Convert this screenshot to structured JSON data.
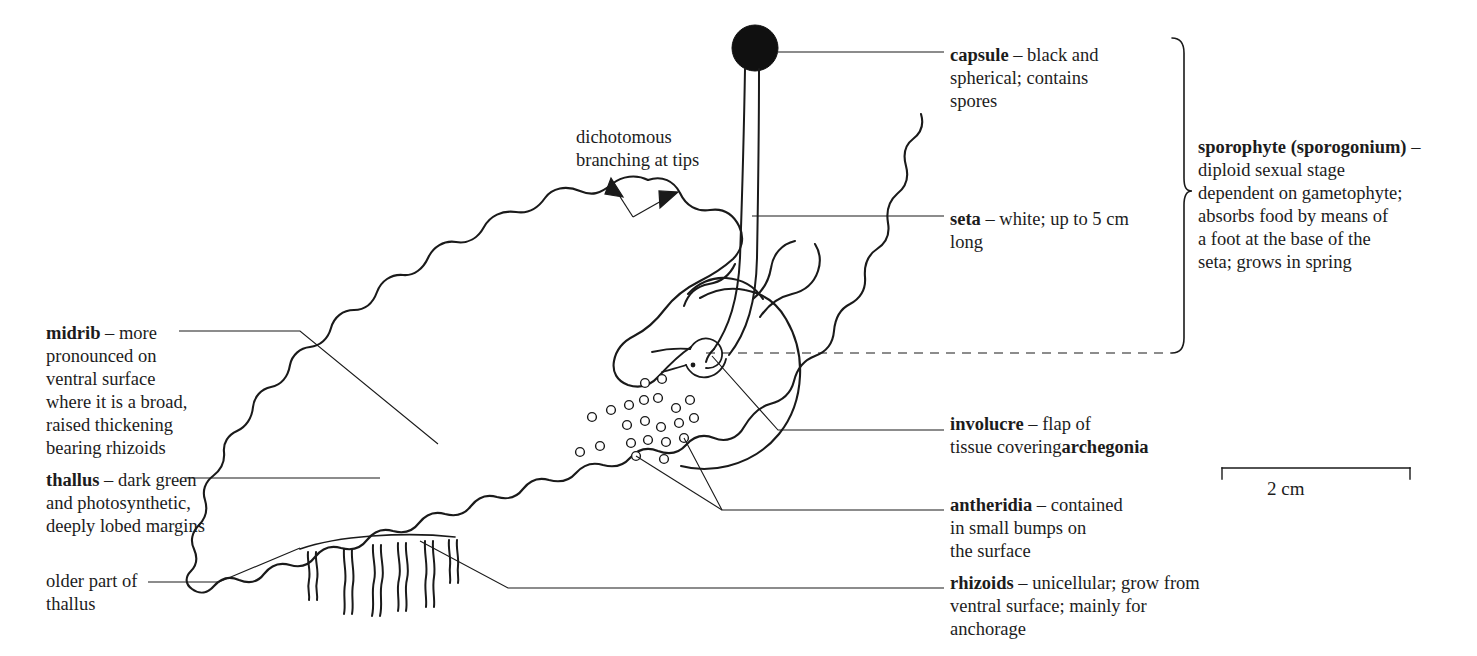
{
  "figure": {
    "organism": "liverwort (thalloid)",
    "ink_color": "#1a1a1a",
    "background_color": "#ffffff"
  },
  "scale_bar": {
    "caption": "2 cm",
    "x_start": 1222,
    "x_end": 1410,
    "y": 468
  },
  "callouts": {
    "capsule": {
      "term": "capsule",
      "dash": " – ",
      "description": "black and\nspherical; contains\nspores",
      "text_x": 950,
      "text_y": 44
    },
    "seta": {
      "term": "seta",
      "dash": " – ",
      "description": "white; up to 5 cm\nlong",
      "text_x": 950,
      "text_y": 208
    },
    "sporophyte": {
      "term": "sporophyte (sporogonium)",
      "dash": " – ",
      "description": "diploid sexual stage\ndependent on gametophyte;\nabsorbs food by means of\na foot at the base of the\nseta; grows in spring",
      "text_x": 1198,
      "text_y": 136
    },
    "involucre": {
      "term": "involucre",
      "dash": " – ",
      "description": "flap of\ntissue covering",
      "term2": "archegonia",
      "text_x": 950,
      "text_y": 413
    },
    "antheridia": {
      "term": "antheridia",
      "dash": " – ",
      "description": "contained\nin small bumps on\nthe surface",
      "text_x": 950,
      "text_y": 494
    },
    "rhizoids": {
      "term": "rhizoids",
      "dash": " – ",
      "description": "unicellular; grow from\nventral surface; mainly for\nanchorage",
      "text_x": 950,
      "text_y": 572
    },
    "midrib": {
      "term": "midrib",
      "dash": " – ",
      "description": "more\npronounced on\nventral surface\nwhere it is a broad,\nraised thickening\nbearing rhizoids",
      "text_x": 46,
      "text_y": 322
    },
    "thallus": {
      "term": "thallus",
      "dash": " – ",
      "description": "dark green\nand photosynthetic,\ndeeply lobed margins",
      "text_x": 46,
      "text_y": 469
    },
    "older_part": {
      "term": "",
      "dash": "",
      "description": "older part of\nthallus",
      "text_x": 46,
      "text_y": 570
    },
    "dichotomous": {
      "term": "",
      "dash": "",
      "description": "dichotomous\nbranching at tips",
      "text_x": 576,
      "text_y": 126
    }
  }
}
